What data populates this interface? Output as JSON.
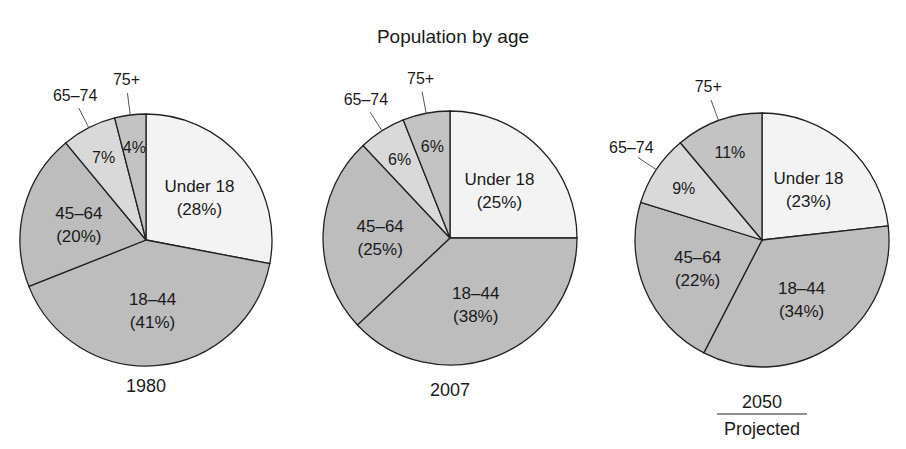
{
  "chart_data": {
    "type": "pie",
    "title": "Population by age",
    "categories": [
      "Under 18",
      "18–44",
      "45–64",
      "65–74",
      "75+"
    ],
    "colors": {
      "Under 18": "#f3f3f3",
      "18–44": "#bdbdbd",
      "45–64": "#bdbdbd",
      "65–74": "#d9d9d9",
      "75+": "#c3c3c3"
    },
    "pies": [
      {
        "label": "1980",
        "sublabel": "",
        "values": [
          28,
          41,
          20,
          7,
          4
        ]
      },
      {
        "label": "2007",
        "sublabel": "",
        "values": [
          25,
          38,
          25,
          6,
          6
        ]
      },
      {
        "label": "2050",
        "sublabel": "Projected",
        "values": [
          23,
          34,
          22,
          9,
          11
        ]
      }
    ]
  }
}
